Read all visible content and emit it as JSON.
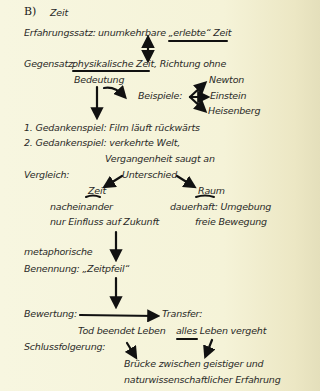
{
  "section": {
    "label": "B)",
    "title": "Zeit"
  },
  "lines": {
    "erfahrungssatz_label": "Erfahrungssatz:",
    "erfahrungssatz_text": "unumkehrbare „erlebte“ Zeit",
    "gegensatz_label": "Gegensatz:",
    "gegensatz_text": "physikalische Zeit, Richtung ohne",
    "bedeutung": "Bedeutung",
    "beispiele": "Beispiele:",
    "examples": [
      "Newton",
      "Einstein",
      "Heisenberg"
    ],
    "gedankenspiel1": "1. Gedankenspiel: Film läuft rückwärts",
    "gedankenspiel2": "2. Gedankenspiel: verkehrte Welt,",
    "vergangenheit": "Vergangenheit saugt an",
    "vergleich": "Vergleich:",
    "unterschied": "Unterschied",
    "zeit": "Zeit",
    "raum": "Raum",
    "zeit_items": [
      "nacheinander",
      "nur Einfluss auf Zukunft"
    ],
    "raum_items": [
      "dauerhaft: Umgebung",
      "freie Bewegung"
    ],
    "metaphorische": "metaphorische",
    "benennung": "Benennung: „Zeitpfeil“",
    "bewertung": "Bewertung:",
    "transfer": "Transfer:",
    "tod": "Tod beendet Leben",
    "alles": "alles Leben vergeht",
    "schluss": "Schlussfolgerung:",
    "bruecke1": "Brücke zwischen geistiger und",
    "bruecke2": "naturwissenschaftlicher Erfahrung"
  }
}
